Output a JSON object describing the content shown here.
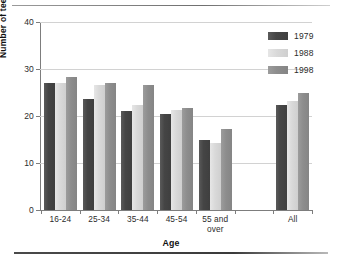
{
  "chart_data": {
    "type": "bar",
    "title": "",
    "xlabel": "Age",
    "ylabel": "Number of teeth",
    "categories": [
      "16-24",
      "25-34",
      "35-44",
      "45-54",
      "55 and over",
      "",
      "All"
    ],
    "series": [
      {
        "name": "1979",
        "color": "#454545",
        "values": [
          27.0,
          23.6,
          21.0,
          20.5,
          15.0,
          null,
          22.3
        ]
      },
      {
        "name": "1988",
        "color": "#d9d9d9",
        "values": [
          27.0,
          26.5,
          22.3,
          21.3,
          14.3,
          null,
          23.3
        ]
      },
      {
        "name": "1998",
        "color": "#8d8d8d",
        "values": [
          28.3,
          27.1,
          26.5,
          21.7,
          17.2,
          null,
          25.0
        ]
      }
    ],
    "ylim": [
      0,
      40
    ],
    "yticks": [
      0,
      10,
      20,
      30,
      40
    ],
    "ytick_labels": [
      "0",
      "10",
      "20",
      "30",
      "40"
    ],
    "grid": true,
    "legend_position": "top-right"
  },
  "axes": {
    "y_title": "Number of teeth",
    "x_title": "Age"
  },
  "legend": {
    "entries": [
      {
        "label": "1979",
        "swatch": "dark-gray-swatch"
      },
      {
        "label": "1988",
        "swatch": "light-gray-swatch"
      },
      {
        "label": "1998",
        "swatch": "medium-gray-swatch"
      }
    ]
  },
  "colors": {
    "series_1979": "#454545",
    "series_1988": "#d9d9d9",
    "series_1998": "#8d8d8d",
    "gridline": "#d2d2d2",
    "axis": "#7d7d7d",
    "background": "#ffffff"
  }
}
